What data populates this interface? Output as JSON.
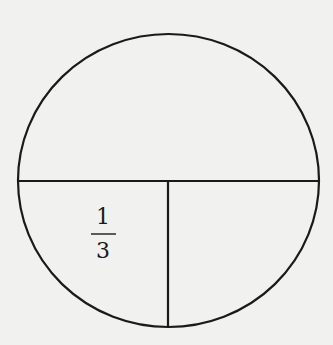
{
  "diagram": {
    "type": "circle-partition",
    "label": {
      "numerator": "1",
      "denominator": "3",
      "region": "lower-left quarter"
    },
    "colors": {
      "background": "#f1f1ef",
      "stroke": "#1a1a1a"
    }
  }
}
